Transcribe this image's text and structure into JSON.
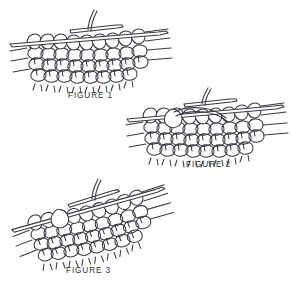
{
  "document": {
    "type": "knitting-instruction-diagram",
    "title": "Knitting stitch technique illustration",
    "background_color": "#ffffff",
    "line_color": "#3a3a42",
    "caption_color": "#2f2f36",
    "figure_count": 3
  },
  "figures": [
    {
      "id": "figure-1",
      "caption": "FIGURE 1",
      "description": "Knitted fabric on a needle with a second needle inserted through two stitches and a working yarn strand rising upward",
      "elements": {
        "needle_count": 2,
        "stitch_rows": 4,
        "stitch_columns": 9,
        "working_yarn": "yes"
      }
    },
    {
      "id": "figure-2",
      "caption": "FIGURE 2",
      "description": "Working yarn looped around the right needle and drawn through the stitches to form a new loop",
      "elements": {
        "needle_count": 2,
        "stitch_rows": 4,
        "stitch_columns": 9,
        "working_yarn": "yes"
      }
    },
    {
      "id": "figure-3",
      "caption": "FIGURE 3",
      "description": "Fabric tilted diagonally with the completed new stitch transferred onto the left needle",
      "elements": {
        "needle_count": 2,
        "stitch_rows": 4,
        "stitch_columns": 9,
        "working_yarn": "yes"
      }
    }
  ]
}
